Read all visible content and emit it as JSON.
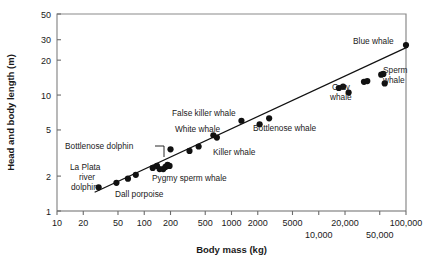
{
  "chart_data": {
    "type": "scatter",
    "title": "",
    "xlabel": "Body mass (kg)",
    "ylabel": "Head and body length (m)",
    "xscale": "log",
    "yscale": "log",
    "xlim": [
      10,
      100000
    ],
    "ylim": [
      1,
      50
    ],
    "grid": false,
    "legend": "none",
    "xticks": [
      {
        "value": 10,
        "label": "10",
        "row": 0
      },
      {
        "value": 20,
        "label": "20",
        "row": 0
      },
      {
        "value": 50,
        "label": "50",
        "row": 0
      },
      {
        "value": 100,
        "label": "100",
        "row": 0
      },
      {
        "value": 200,
        "label": "200",
        "row": 0
      },
      {
        "value": 500,
        "label": "500",
        "row": 0
      },
      {
        "value": 1000,
        "label": "1000",
        "row": 0
      },
      {
        "value": 2000,
        "label": "2000",
        "row": 0
      },
      {
        "value": 5000,
        "label": "5000",
        "row": 0
      },
      {
        "value": 10000,
        "label": "10,000",
        "row": 1
      },
      {
        "value": 20000,
        "label": "20,000",
        "row": 0
      },
      {
        "value": 50000,
        "label": "50,000",
        "row": 1
      },
      {
        "value": 100000,
        "label": "100,000",
        "row": 0
      }
    ],
    "yticks": [
      {
        "value": 1,
        "label": "1"
      },
      {
        "value": 2,
        "label": "2"
      },
      {
        "value": 5,
        "label": "5"
      },
      {
        "value": 10,
        "label": "10"
      },
      {
        "value": 20,
        "label": "20"
      },
      {
        "value": 30,
        "label": "30"
      },
      {
        "value": 50,
        "label": "50"
      }
    ],
    "points": [
      {
        "x": 30,
        "y": 1.6
      },
      {
        "x": 48,
        "y": 1.75
      },
      {
        "x": 65,
        "y": 1.9
      },
      {
        "x": 80,
        "y": 2.05
      },
      {
        "x": 125,
        "y": 2.35
      },
      {
        "x": 140,
        "y": 2.45
      },
      {
        "x": 150,
        "y": 2.3
      },
      {
        "x": 165,
        "y": 2.3
      },
      {
        "x": 175,
        "y": 2.4
      },
      {
        "x": 185,
        "y": 2.5
      },
      {
        "x": 195,
        "y": 2.45
      },
      {
        "x": 200,
        "y": 3.4
      },
      {
        "x": 330,
        "y": 3.3
      },
      {
        "x": 420,
        "y": 3.6
      },
      {
        "x": 620,
        "y": 4.5
      },
      {
        "x": 680,
        "y": 4.3
      },
      {
        "x": 1300,
        "y": 6.0
      },
      {
        "x": 2100,
        "y": 5.6
      },
      {
        "x": 2700,
        "y": 6.3
      },
      {
        "x": 17000,
        "y": 11.5
      },
      {
        "x": 19000,
        "y": 11.8
      },
      {
        "x": 22000,
        "y": 10.5
      },
      {
        "x": 33000,
        "y": 13.0
      },
      {
        "x": 36000,
        "y": 13.2
      },
      {
        "x": 52000,
        "y": 15.0
      },
      {
        "x": 55000,
        "y": 15.2
      },
      {
        "x": 57000,
        "y": 12.6
      },
      {
        "x": 100000,
        "y": 27.0
      }
    ],
    "fit_line": {
      "x_start": 27,
      "y_start": 1.45,
      "x_end": 105000,
      "y_end": 26.0
    },
    "annotations": [
      {
        "id": "blue-whale",
        "text": "Blue whale",
        "x": 353,
        "y": 44,
        "anchor": "start"
      },
      {
        "id": "sperm-whale-line1",
        "text": "Sperm",
        "x": 383,
        "y": 73,
        "anchor": "start"
      },
      {
        "id": "sperm-whale-line2",
        "text": "whale",
        "x": 383,
        "y": 83,
        "anchor": "start"
      },
      {
        "id": "gray-whale-line1",
        "text": "Gray",
        "x": 332,
        "y": 90,
        "anchor": "start"
      },
      {
        "id": "gray-whale-line2",
        "text": "whale",
        "x": 330,
        "y": 100,
        "anchor": "start"
      },
      {
        "id": "false-killer-whale",
        "text": "False killer whale",
        "x": 172,
        "y": 116,
        "anchor": "start"
      },
      {
        "id": "white-whale",
        "text": "White whale",
        "x": 175,
        "y": 132,
        "anchor": "start"
      },
      {
        "id": "bottlenose-whale",
        "text": "Bottlenose whale",
        "x": 253,
        "y": 131,
        "anchor": "start"
      },
      {
        "id": "killer-whale",
        "text": "Killer whale",
        "x": 213,
        "y": 155,
        "anchor": "start"
      },
      {
        "id": "bottlenose-dolphin",
        "text": "Bottlenose dolphin",
        "x": 65,
        "y": 149,
        "anchor": "start"
      },
      {
        "id": "la-plata-line1",
        "text": "La Plata",
        "x": 70,
        "y": 170,
        "anchor": "start"
      },
      {
        "id": "la-plata-line2",
        "text": "river",
        "x": 79,
        "y": 180,
        "anchor": "start"
      },
      {
        "id": "la-plata-line3",
        "text": "dolphin",
        "x": 71,
        "y": 190,
        "anchor": "start"
      },
      {
        "id": "pygmy-sperm-whale",
        "text": "Pygmy sperm whale",
        "x": 152,
        "y": 181,
        "anchor": "start"
      },
      {
        "id": "dall-porpoise",
        "text": "Dall porpoise",
        "x": 115,
        "y": 197,
        "anchor": "start"
      }
    ]
  }
}
